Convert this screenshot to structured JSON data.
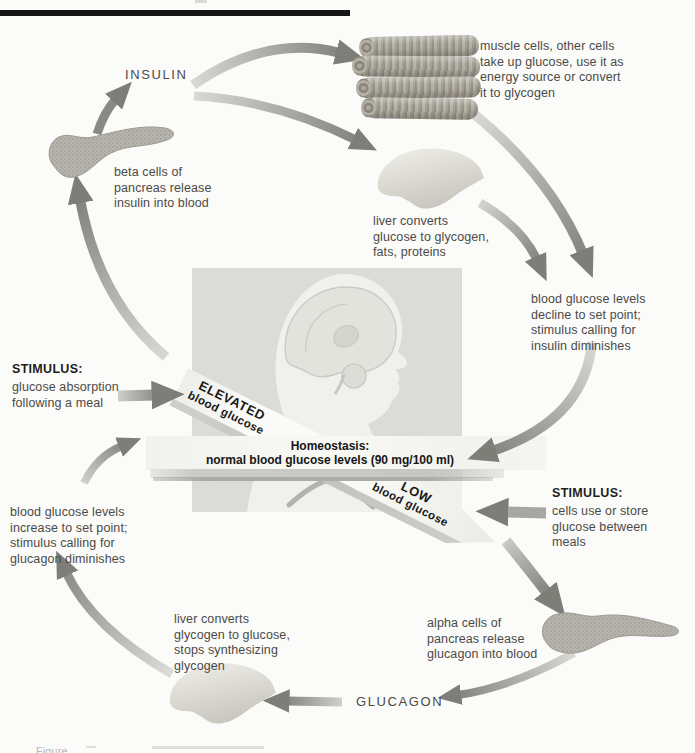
{
  "labels": {
    "insulin": "INSULIN",
    "glucagon": "GLUCAGON"
  },
  "notes": {
    "muscle": "muscle cells, other cells\ntake up glucose, use it as\nenergy source or convert\nit to glycogen",
    "beta_cells": "beta cells of\npancreas release\ninsulin into blood",
    "liver_glycogen": "liver converts\nglucose to glycogen,\nfats, proteins",
    "glucose_decline": "blood glucose levels\ndecline to set point;\nstimulus calling for\ninsulin diminishes",
    "glucose_increase": "blood glucose levels\nincrease to set point;\nstimulus calling for\nglucagon diminishes",
    "alpha_cells": "alpha cells of\npancreas release\nglucagon into blood",
    "liver_glucose": "liver converts\nglycogen to glucose,\nstops synthesizing\nglycogen"
  },
  "stimulus_left": {
    "title": "STIMULUS:",
    "body": "glucose absorption\nfollowing a meal"
  },
  "stimulus_right": {
    "title": "STIMULUS:",
    "body": "cells use or store\nglucose between\nmeals"
  },
  "seesaw": {
    "elevated": {
      "line1": "ELEVATED",
      "line2": "blood glucose"
    },
    "homeostasis": {
      "line1": "Homeostasis:",
      "line2": "normal blood glucose levels (90 mg/100 ml)"
    },
    "low": {
      "line1": "LOW",
      "line2": "blood glucose"
    }
  },
  "caption_fragment": "Figure",
  "figures": {
    "pancreas_top": "pancreas",
    "pancreas_bottom": "pancreas",
    "liver_top": "liver",
    "liver_bottom": "liver",
    "muscle": "muscle-fibers",
    "head": "head-profile-with-brain"
  },
  "colors": {
    "arrow_gray": "#9b9b96",
    "panel_gray": "#dbdbd8",
    "band_white": "#f8f8f5",
    "text_dark": "#4b4a47",
    "top_bar": "#161616"
  }
}
